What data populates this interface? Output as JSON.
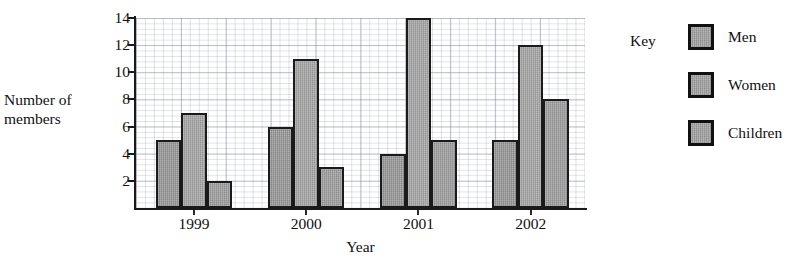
{
  "chart_data": {
    "type": "bar",
    "title": "",
    "xlabel": "Year",
    "ylabel_line1": "Number of",
    "ylabel_line2": "members",
    "categories": [
      "1999",
      "2000",
      "2001",
      "2002"
    ],
    "series": [
      {
        "name": "Men",
        "values": [
          5,
          6,
          4,
          5
        ]
      },
      {
        "name": "Women",
        "values": [
          7,
          11,
          14,
          12
        ]
      },
      {
        "name": "Children",
        "values": [
          2,
          3,
          5,
          8
        ]
      }
    ],
    "ylim": [
      0,
      14
    ],
    "yticks": [
      2,
      4,
      6,
      8,
      10,
      12,
      14
    ],
    "ytick_labels": [
      "2",
      "4",
      "6",
      "8",
      "10",
      "12",
      "14"
    ],
    "grid": true,
    "grid_style": "graph-paper",
    "legend_position": "right",
    "legend_title": "Key",
    "bar_fill_color": "#9d9d9d",
    "bar_border_color": "#1a1a1a",
    "axis_color": "#1a1a1a",
    "background_color": "#ffffff",
    "text_color": "#111111"
  }
}
